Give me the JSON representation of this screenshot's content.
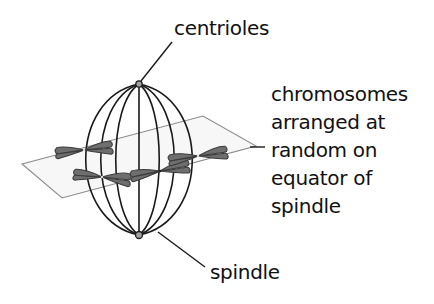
{
  "diagram": {
    "colors": {
      "spindle_line": "#1a1a1a",
      "plane_line": "#8a8a8a",
      "plane_fill": "#f7f7f7",
      "chromosome_fill": "#6e6e6e",
      "chromosome_outline": "#3a3a3a",
      "centriole_fill": "#a0a0a0",
      "text": "#111111"
    },
    "labels": {
      "centrioles": "centrioles",
      "chromosomes": [
        "chromosomes",
        "arranged at",
        "random on",
        "equator of",
        "spindle"
      ],
      "spindle": "spindle"
    },
    "structures": {
      "spindle": {
        "top_pole": [
          139,
          84
        ],
        "bottom_pole": [
          139,
          235
        ],
        "half_width": 58
      },
      "equatorial_plane": [
        [
          22,
          164
        ],
        [
          203,
          116
        ],
        [
          256,
          146
        ],
        [
          62,
          198
        ]
      ],
      "chromosomes": [
        {
          "id": 1,
          "center": [
            84,
            150
          ]
        },
        {
          "id": 2,
          "center": [
            102,
            177
          ]
        },
        {
          "id": 3,
          "center": [
            160,
            171
          ]
        },
        {
          "id": 4,
          "center": [
            198,
            156
          ]
        }
      ]
    }
  }
}
